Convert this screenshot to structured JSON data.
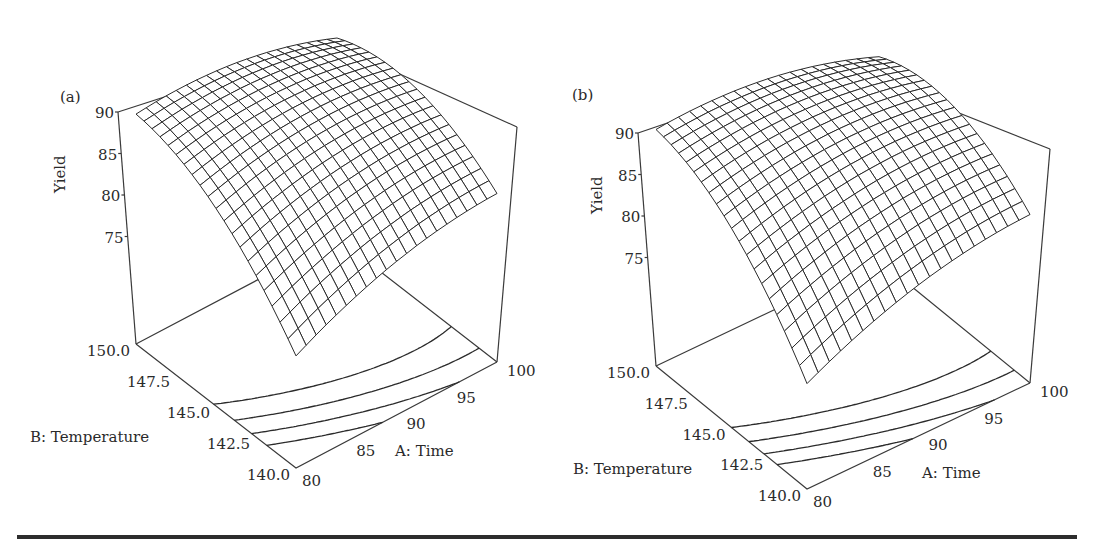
{
  "chart_data": [
    {
      "type": "surface",
      "panel_label": "(a)",
      "title": "",
      "zlabel": "Yield",
      "xlabel": "A: Time",
      "ylabel": "B: Temperature",
      "z_ticks": [
        "90",
        "85",
        "80",
        "75"
      ],
      "x_ticks": [
        "80",
        "85",
        "90",
        "95",
        "100"
      ],
      "y_ticks": [
        "150.0",
        "147.5",
        "145.0",
        "142.5",
        "140.0"
      ],
      "x_range": [
        80,
        100
      ],
      "y_range": [
        140,
        150
      ],
      "z_range": [
        62,
        90
      ],
      "grid_resolution": 21,
      "corner_values": {
        "A80_T150": 88,
        "A100_T150": 85,
        "A80_T140": 78,
        "A100_T140": 81
      },
      "max_yield_approx": 89,
      "contour_count": 4
    },
    {
      "type": "surface",
      "panel_label": "(b)",
      "title": "",
      "zlabel": "Yield",
      "xlabel": "A: Time",
      "ylabel": "B: Temperature",
      "z_ticks": [
        "90",
        "85",
        "80",
        "75"
      ],
      "x_ticks": [
        "80",
        "85",
        "90",
        "95",
        "100"
      ],
      "y_ticks": [
        "150.0",
        "147.5",
        "145.0",
        "142.5",
        "140.0"
      ],
      "x_range": [
        80,
        100
      ],
      "y_range": [
        140,
        150
      ],
      "z_range": [
        62,
        90
      ],
      "grid_resolution": 21,
      "corner_values": {
        "A80_T150": 88.5,
        "A100_T150": 85,
        "A80_T140": 77,
        "A100_T140": 80
      },
      "max_yield_approx": 89.5,
      "contour_count": 4
    }
  ],
  "panels": [
    {
      "label": "(a)",
      "ylabel": "Yield",
      "xlabel": "A: Time",
      "tlabel": "B: Temperature",
      "geom": {
        "floorBackLeft": [
          136,
          344
        ],
        "floorFront": [
          296,
          468
        ],
        "floorRight": [
          497,
          362
        ],
        "zTopY": 112,
        "zPerUnit": 8.3,
        "zFloor": 62,
        "backTop": [
          331,
          43
        ]
      },
      "model": {
        "b0": 88.2,
        "bA": 0.8,
        "bT": 4.5,
        "bAA": -1.6,
        "bTT": -3.2,
        "bAT": -2.6
      }
    },
    {
      "label": "(b)",
      "ylabel": "Yield",
      "xlabel": "A: Time",
      "tlabel": "B: Temperature",
      "geom": {
        "floorBackLeft": [
          656,
          366
        ],
        "floorFront": [
          807,
          489
        ],
        "floorRight": [
          1030,
          383
        ],
        "zTopY": 133,
        "zPerUnit": 8.3,
        "zFloor": 62,
        "backTop": [
          838,
          65
        ]
      },
      "model": {
        "b0": 88.6,
        "bA": 0.9,
        "bT": 5.0,
        "bAA": -1.7,
        "bTT": -3.4,
        "bAT": -2.9
      }
    }
  ],
  "ticks": {
    "z": [
      "90",
      "85",
      "80",
      "75"
    ],
    "time": [
      "80",
      "85",
      "90",
      "95",
      "100"
    ],
    "temperature": [
      "150.0",
      "147.5",
      "145.0",
      "142.5",
      "140.0"
    ]
  },
  "colors": {
    "ink": "#2b2b2b",
    "background": "#ffffff"
  }
}
